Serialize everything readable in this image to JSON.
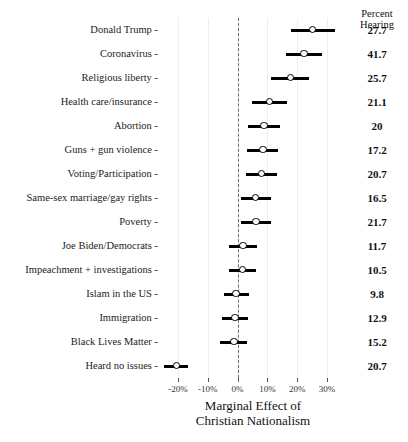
{
  "chart_data": {
    "type": "scatter",
    "title": "",
    "xlabel": "Marginal Effect of Christian Nationalism",
    "ylabel": "",
    "xlim": [
      -0.26,
      0.36
    ],
    "xticks": [
      -0.2,
      -0.1,
      0.0,
      0.1,
      0.2,
      0.3
    ],
    "xticklabels": [
      "-20%",
      "-10%",
      "0%",
      "10%",
      "20%",
      "30%"
    ],
    "grid": true,
    "legend": false,
    "zero_reference_line": true,
    "value_column_header": "Percent\nHearing",
    "categories": [
      "Donald Trump",
      "Coronavirus",
      "Religious liberty",
      "Health care/insurance",
      "Abortion",
      "Guns + gun violence",
      "Voting/Participation",
      "Same-sex marriage/gay rights",
      "Poverty",
      "Joe Biden/Democrats",
      "Impeachment + investigations",
      "Islam in the US",
      "Immigration",
      "Black Lives Matter",
      "Heard no issues"
    ],
    "points": [
      {
        "label": "Donald Trump",
        "estimate": 0.252,
        "low": 0.178,
        "high": 0.325,
        "percent_hearing": "27.7"
      },
      {
        "label": "Coronavirus",
        "estimate": 0.222,
        "low": 0.163,
        "high": 0.283,
        "percent_hearing": "41.7"
      },
      {
        "label": "Religious liberty",
        "estimate": 0.178,
        "low": 0.113,
        "high": 0.24,
        "percent_hearing": "25.7"
      },
      {
        "label": "Health care/insurance",
        "estimate": 0.107,
        "low": 0.048,
        "high": 0.167,
        "percent_hearing": "21.1"
      },
      {
        "label": "Abortion",
        "estimate": 0.088,
        "low": 0.035,
        "high": 0.142,
        "percent_hearing": "20"
      },
      {
        "label": "Guns + gun violence",
        "estimate": 0.085,
        "low": 0.03,
        "high": 0.137,
        "percent_hearing": "17.2"
      },
      {
        "label": "Voting/Participation",
        "estimate": 0.08,
        "low": 0.028,
        "high": 0.132,
        "percent_hearing": "20.7"
      },
      {
        "label": "Same-sex marriage/gay rights",
        "estimate": 0.06,
        "low": 0.012,
        "high": 0.113,
        "percent_hearing": "16.5"
      },
      {
        "label": "Poverty",
        "estimate": 0.062,
        "low": 0.013,
        "high": 0.112,
        "percent_hearing": "21.7"
      },
      {
        "label": "Joe Biden/Democrats",
        "estimate": 0.018,
        "low": -0.028,
        "high": 0.065,
        "percent_hearing": "11.7"
      },
      {
        "label": "Impeachment + investigations",
        "estimate": 0.016,
        "low": -0.028,
        "high": 0.063,
        "percent_hearing": "10.5"
      },
      {
        "label": "Islam in the US",
        "estimate": -0.005,
        "low": -0.047,
        "high": 0.038,
        "percent_hearing": "9.8"
      },
      {
        "label": "Immigration",
        "estimate": -0.008,
        "low": -0.053,
        "high": 0.036,
        "percent_hearing": "12.9"
      },
      {
        "label": "Black Lives Matter",
        "estimate": -0.012,
        "low": -0.058,
        "high": 0.03,
        "percent_hearing": "15.2"
      },
      {
        "label": "Heard no issues",
        "estimate": -0.205,
        "low": -0.245,
        "high": -0.165,
        "percent_hearing": "20.7"
      }
    ]
  },
  "colors": {
    "point_fill": "#ffffff",
    "point_stroke": "#000000",
    "bar": "#000000",
    "zero_line": "#6b6b6b",
    "grid": "#ededed",
    "background": "#ffffff"
  }
}
